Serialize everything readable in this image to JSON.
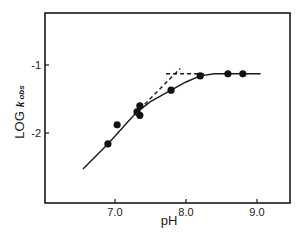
{
  "chart_data": {
    "type": "scatter",
    "title": "",
    "xlabel": "pH",
    "ylabel": "LOG k obs",
    "ylabel_parts": {
      "main": "LOG",
      "italic": "k",
      "subscript": "obs"
    },
    "xlim": [
      6.0,
      9.5
    ],
    "ylim": [
      -3.0,
      -0.2
    ],
    "x_ticks": [
      7.0,
      8.0,
      9.0
    ],
    "x_tick_labels": [
      "7.0",
      "8.0",
      "9.0"
    ],
    "y_ticks": [
      -1,
      -2
    ],
    "y_tick_labels": [
      "-1",
      "-2"
    ],
    "grid": false,
    "legend": null,
    "series": [
      {
        "name": "observed",
        "kind": "points",
        "points": [
          {
            "x": 6.9,
            "y": -2.16
          },
          {
            "x": 7.03,
            "y": -1.88
          },
          {
            "x": 7.31,
            "y": -1.69
          },
          {
            "x": 7.35,
            "y": -1.6
          },
          {
            "x": 7.35,
            "y": -1.74
          },
          {
            "x": 7.79,
            "y": -1.37
          },
          {
            "x": 8.2,
            "y": -1.16
          },
          {
            "x": 8.59,
            "y": -1.13
          },
          {
            "x": 8.8,
            "y": -1.13
          }
        ]
      },
      {
        "name": "fitted curve",
        "kind": "solid-line",
        "points": [
          {
            "x": 6.55,
            "y": -2.53
          },
          {
            "x": 6.9,
            "y": -2.16
          },
          {
            "x": 7.1,
            "y": -1.93
          },
          {
            "x": 7.3,
            "y": -1.7
          },
          {
            "x": 7.5,
            "y": -1.54
          },
          {
            "x": 7.79,
            "y": -1.37
          },
          {
            "x": 8.0,
            "y": -1.25
          },
          {
            "x": 8.2,
            "y": -1.16
          },
          {
            "x": 8.4,
            "y": -1.13
          },
          {
            "x": 9.05,
            "y": -1.13
          }
        ]
      },
      {
        "name": "asymptote slope",
        "kind": "dashed-line",
        "points": [
          {
            "x": 7.35,
            "y": -1.65
          },
          {
            "x": 7.92,
            "y": -1.05
          }
        ]
      },
      {
        "name": "asymptote plateau",
        "kind": "dashed-line",
        "points": [
          {
            "x": 7.72,
            "y": -1.13
          },
          {
            "x": 8.25,
            "y": -1.13
          }
        ]
      }
    ]
  }
}
